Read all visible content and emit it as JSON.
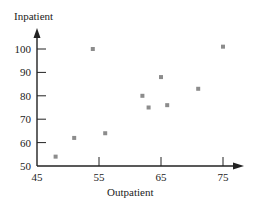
{
  "chart_data": {
    "type": "scatter",
    "title": "",
    "xlabel": "Outpatient",
    "ylabel": "Inpatient",
    "xlim": [
      45,
      77
    ],
    "ylim": [
      50,
      106
    ],
    "x_ticks": [
      45,
      55,
      65,
      75
    ],
    "y_ticks": [
      50,
      60,
      70,
      80,
      90,
      100
    ],
    "grid": false,
    "legend": null,
    "point_color": "#8c8c8c",
    "axis_color": "#222222",
    "series": [
      {
        "name": "Hospitals",
        "points": [
          {
            "x": 48,
            "y": 54
          },
          {
            "x": 51,
            "y": 62
          },
          {
            "x": 56,
            "y": 64
          },
          {
            "x": 54,
            "y": 100
          },
          {
            "x": 62,
            "y": 80
          },
          {
            "x": 63,
            "y": 75
          },
          {
            "x": 66,
            "y": 76
          },
          {
            "x": 65,
            "y": 88
          },
          {
            "x": 71,
            "y": 83
          },
          {
            "x": 75,
            "y": 101
          }
        ]
      }
    ]
  }
}
